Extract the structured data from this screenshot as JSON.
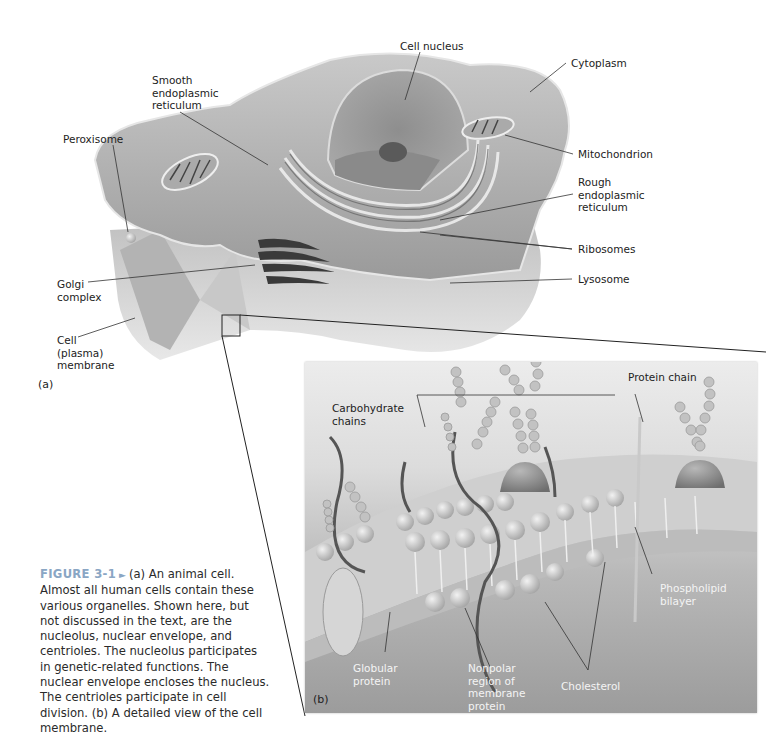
{
  "figure": {
    "number": "FIGURE 3-1",
    "arrow_glyph": "►",
    "caption": "(a) An animal cell. Almost all human cells contain these various organelles. Shown here, but not discussed in the text, are the nucleolus, nuclear envelope, and centrioles. The nucleolus participates in genetic-related functions. The nuclear envelope encloses the nucleus. The centrioles participate in cell division. (b) A detailed view of the cell membrane.",
    "accent_color": "#8aa6c4"
  },
  "panel_a": {
    "tag": "(a)",
    "labels": {
      "cell_nucleus": "Cell nucleus",
      "smooth_er": "Smooth\nendoplasmic\nreticulum",
      "cytoplasm": "Cytoplasm",
      "peroxisome": "Peroxisome",
      "mitochondrion": "Mitochondrion",
      "rough_er": "Rough\nendoplasmic\nreticulum",
      "ribosomes": "Ribosomes",
      "golgi": "Golgi\ncomplex",
      "lysosome": "Lysosome",
      "cell_membrane": "Cell\n(plasma)\nmembrane"
    }
  },
  "panel_b": {
    "tag": "(b)",
    "labels": {
      "carbohydrate_chains": "Carbohydrate\nchains",
      "protein_chain": "Protein chain",
      "phospholipid_bilayer": "Phospholipid\nbilayer",
      "globular_protein": "Globular\nprotein",
      "nonpolar_region": "Nonpolar\nregion of\nmembrane\nprotein",
      "cholesterol": "Cholesterol"
    }
  }
}
